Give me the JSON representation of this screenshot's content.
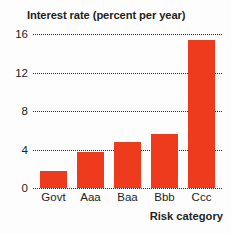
{
  "chart_data": {
    "type": "bar",
    "title": "Interest rate (percent per year)",
    "xlabel": "Risk category",
    "ylabel": "Interest rate (percent per year)",
    "categories": [
      "Govt",
      "Aaa",
      "Baa",
      "Bbb",
      "Ccc"
    ],
    "values": [
      1.8,
      3.7,
      4.8,
      5.6,
      15.4
    ],
    "ylim": [
      0,
      16
    ],
    "yticks": [
      0,
      4,
      8,
      12,
      16
    ],
    "ytick_labels": [
      "0",
      "4",
      "8",
      "12",
      "16"
    ],
    "grid": "horizontal-dotted",
    "legend": "none",
    "bar_color": "#ee3b1e",
    "grid_color": "#2b2725",
    "text_color": "#231f20",
    "background_color": "#fdfdfd"
  }
}
